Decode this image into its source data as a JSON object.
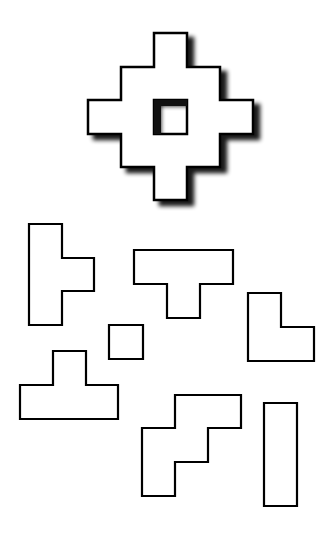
{
  "puzzle": {
    "description": "Polyomino tiling puzzle: target shape with hole above, loose pieces below",
    "stroke_color": "#000000",
    "fill_color": "#ffffff",
    "shadow_color": "#000000",
    "target": {
      "name": "diamond-ring-target",
      "points": "154,33 187,33 187,67 220,67 220,100 253,100 253,134 220,134 220,167 187,167 187,200 154,200 154,167 121,167 121,134 88,134 88,100 121,100 121,67 154,67",
      "hole": "154,100 187,100 187,134 154,134"
    },
    "pieces": [
      {
        "name": "piece-t-vertical",
        "points": "29,224 62,224 62,258 94,258 94,291 62,291 62,325 29,325"
      },
      {
        "name": "piece-t-down",
        "points": "134,250 233,250 233,284 200,284 200,318 167,318 167,284 134,284"
      },
      {
        "name": "piece-l",
        "points": "248,293 281,293 281,327 314,327 314,361 248,361"
      },
      {
        "name": "piece-square",
        "points": "109,325 143,325 143,359 109,359"
      },
      {
        "name": "piece-t-up",
        "points": "53,351 86,351 86,385 118,385 118,419 20,419 20,385 53,385"
      },
      {
        "name": "piece-stair",
        "points": "175,395 241,395 241,428 208,428 208,462 175,462 175,496 142,496 142,428 175,428"
      },
      {
        "name": "piece-bar",
        "points": "264,403 297,403 297,506 264,506"
      }
    ]
  }
}
